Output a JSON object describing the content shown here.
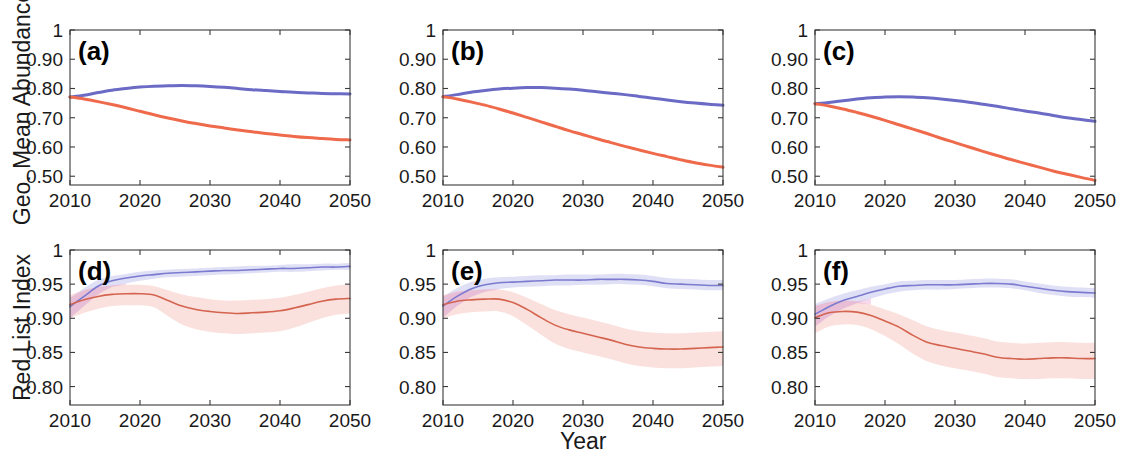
{
  "figure": {
    "width": 1126,
    "height": 458,
    "background": "#ffffff",
    "axis_labels": {
      "y_top": "Geo. Mean Abundance",
      "y_bottom": "Red List Index",
      "x": "Year"
    },
    "colors": {
      "blue_line": "#6b6bc6",
      "red_line": "#ee6a4b",
      "blue_line_thin": "#7b7bd0",
      "red_line_thin": "#d4644f",
      "blue_band": "#b9b9e8",
      "red_band": "#f3bdb4",
      "magenta_band": "#e8a6d8",
      "axis": "#3a3a3a",
      "text": "#1a1a1a"
    }
  },
  "chart_data": [
    {
      "type": "line",
      "panel": "a",
      "panel_label": "(a)",
      "title": "",
      "xlabel": "",
      "ylabel": "Geo. Mean Abundance",
      "xlim": [
        2010,
        2050
      ],
      "ylim": [
        0.47,
        1.0
      ],
      "xticks": [
        2010,
        2020,
        2030,
        2040,
        2050
      ],
      "xticklabels": [
        "2010",
        "2020",
        "2030",
        "2040",
        "2050"
      ],
      "yticks": [
        0.5,
        0.6,
        0.7,
        0.8,
        0.9,
        1.0
      ],
      "yticklabels": [
        "0.50",
        "0.60",
        "0.70",
        "0.80",
        "0.90",
        "1"
      ],
      "grid": false,
      "legend": "none",
      "x": [
        2010,
        2012,
        2014,
        2016,
        2018,
        2020,
        2022,
        2024,
        2026,
        2028,
        2030,
        2032,
        2034,
        2036,
        2038,
        2040,
        2042,
        2044,
        2046,
        2048,
        2050
      ],
      "series": [
        {
          "name": "blue",
          "color": "#6b6bc6",
          "values": [
            0.771,
            0.777,
            0.786,
            0.794,
            0.8,
            0.805,
            0.808,
            0.809,
            0.81,
            0.809,
            0.807,
            0.804,
            0.8,
            0.796,
            0.793,
            0.79,
            0.787,
            0.785,
            0.783,
            0.782,
            0.781
          ]
        },
        {
          "name": "red",
          "color": "#ee6a4b",
          "values": [
            0.771,
            0.764,
            0.755,
            0.745,
            0.734,
            0.722,
            0.71,
            0.699,
            0.689,
            0.68,
            0.672,
            0.665,
            0.658,
            0.652,
            0.646,
            0.641,
            0.636,
            0.632,
            0.629,
            0.626,
            0.624
          ]
        }
      ]
    },
    {
      "type": "line",
      "panel": "b",
      "panel_label": "(b)",
      "title": "",
      "xlabel": "",
      "ylabel": "Geo. Mean Abundance",
      "xlim": [
        2010,
        2050
      ],
      "ylim": [
        0.47,
        1.0
      ],
      "xticks": [
        2010,
        2020,
        2030,
        2040,
        2050
      ],
      "xticklabels": [
        "2010",
        "2020",
        "2030",
        "2040",
        "2050"
      ],
      "yticks": [
        0.5,
        0.6,
        0.7,
        0.8,
        0.9,
        1.0
      ],
      "yticklabels": [
        "0.50",
        "0.60",
        "0.70",
        "0.80",
        "0.90",
        "1"
      ],
      "grid": false,
      "legend": "none",
      "x": [
        2010,
        2012,
        2014,
        2016,
        2018,
        2020,
        2022,
        2024,
        2026,
        2028,
        2030,
        2032,
        2034,
        2036,
        2038,
        2040,
        2042,
        2044,
        2046,
        2048,
        2050
      ],
      "series": [
        {
          "name": "blue",
          "color": "#6b6bc6",
          "values": [
            0.772,
            0.779,
            0.787,
            0.793,
            0.798,
            0.801,
            0.803,
            0.803,
            0.801,
            0.798,
            0.794,
            0.789,
            0.784,
            0.779,
            0.773,
            0.767,
            0.761,
            0.755,
            0.75,
            0.746,
            0.743
          ]
        },
        {
          "name": "red",
          "color": "#ee6a4b",
          "values": [
            0.772,
            0.764,
            0.754,
            0.743,
            0.73,
            0.716,
            0.701,
            0.686,
            0.671,
            0.656,
            0.642,
            0.628,
            0.615,
            0.602,
            0.59,
            0.578,
            0.567,
            0.556,
            0.546,
            0.538,
            0.531
          ]
        }
      ]
    },
    {
      "type": "line",
      "panel": "c",
      "panel_label": "(c)",
      "title": "",
      "xlabel": "",
      "ylabel": "Geo. Mean Abundance",
      "xlim": [
        2010,
        2050
      ],
      "ylim": [
        0.47,
        1.0
      ],
      "xticks": [
        2010,
        2020,
        2030,
        2040,
        2050
      ],
      "xticklabels": [
        "2010",
        "2020",
        "2030",
        "2040",
        "2050"
      ],
      "yticks": [
        0.5,
        0.6,
        0.7,
        0.8,
        0.9,
        1.0
      ],
      "yticklabels": [
        "0.50",
        "0.60",
        "0.70",
        "0.80",
        "0.90",
        "1"
      ],
      "grid": false,
      "legend": "none",
      "x": [
        2010,
        2012,
        2014,
        2016,
        2018,
        2020,
        2022,
        2024,
        2026,
        2028,
        2030,
        2032,
        2034,
        2036,
        2038,
        2040,
        2042,
        2044,
        2046,
        2048,
        2050
      ],
      "series": [
        {
          "name": "blue",
          "color": "#6b6bc6",
          "values": [
            0.748,
            0.752,
            0.758,
            0.764,
            0.768,
            0.771,
            0.772,
            0.771,
            0.768,
            0.764,
            0.759,
            0.753,
            0.746,
            0.739,
            0.731,
            0.723,
            0.716,
            0.708,
            0.7,
            0.694,
            0.688
          ]
        },
        {
          "name": "red",
          "color": "#ee6a4b",
          "values": [
            0.748,
            0.74,
            0.73,
            0.718,
            0.705,
            0.691,
            0.676,
            0.661,
            0.646,
            0.63,
            0.615,
            0.6,
            0.585,
            0.571,
            0.557,
            0.544,
            0.531,
            0.518,
            0.507,
            0.496,
            0.486
          ]
        }
      ]
    },
    {
      "type": "line",
      "panel": "d",
      "panel_label": "(d)",
      "title": "",
      "xlabel": "Year",
      "ylabel": "Red List Index",
      "xlim": [
        2010,
        2050
      ],
      "ylim": [
        0.773,
        1.0
      ],
      "xticks": [
        2010,
        2020,
        2030,
        2040,
        2050
      ],
      "xticklabels": [
        "2010",
        "2020",
        "2030",
        "2040",
        "2050"
      ],
      "yticks": [
        0.8,
        0.85,
        0.9,
        0.95,
        1.0
      ],
      "yticklabels": [
        "0.80",
        "0.85",
        "0.90",
        "0.95",
        "1"
      ],
      "grid": false,
      "legend": "none",
      "x": [
        2010,
        2012,
        2014,
        2016,
        2018,
        2020,
        2022,
        2024,
        2026,
        2028,
        2030,
        2032,
        2034,
        2036,
        2038,
        2040,
        2042,
        2044,
        2046,
        2048,
        2050
      ],
      "series": [
        {
          "name": "blue",
          "color": "#7b7bd0",
          "values": [
            0.917,
            0.932,
            0.947,
            0.955,
            0.959,
            0.962,
            0.964,
            0.966,
            0.967,
            0.968,
            0.969,
            0.97,
            0.97,
            0.971,
            0.972,
            0.973,
            0.973,
            0.974,
            0.975,
            0.975,
            0.976
          ],
          "band_low": [
            0.9,
            0.918,
            0.935,
            0.946,
            0.951,
            0.955,
            0.958,
            0.96,
            0.961,
            0.962,
            0.963,
            0.964,
            0.965,
            0.966,
            0.967,
            0.968,
            0.968,
            0.969,
            0.97,
            0.971,
            0.971
          ],
          "band_high": [
            0.93,
            0.944,
            0.956,
            0.962,
            0.965,
            0.968,
            0.97,
            0.971,
            0.972,
            0.973,
            0.974,
            0.975,
            0.976,
            0.977,
            0.977,
            0.978,
            0.979,
            0.979,
            0.98,
            0.98,
            0.981
          ]
        },
        {
          "name": "red",
          "color": "#d4644f",
          "values": [
            0.92,
            0.927,
            0.932,
            0.935,
            0.936,
            0.936,
            0.934,
            0.926,
            0.918,
            0.913,
            0.91,
            0.908,
            0.907,
            0.908,
            0.909,
            0.911,
            0.915,
            0.92,
            0.925,
            0.928,
            0.929
          ],
          "band_low": [
            0.9,
            0.908,
            0.914,
            0.918,
            0.919,
            0.919,
            0.916,
            0.903,
            0.891,
            0.884,
            0.88,
            0.878,
            0.877,
            0.878,
            0.879,
            0.881,
            0.886,
            0.893,
            0.9,
            0.905,
            0.907
          ],
          "band_high": [
            0.934,
            0.941,
            0.946,
            0.948,
            0.949,
            0.949,
            0.947,
            0.941,
            0.935,
            0.931,
            0.928,
            0.926,
            0.926,
            0.927,
            0.928,
            0.93,
            0.934,
            0.939,
            0.944,
            0.948,
            0.95
          ]
        }
      ]
    },
    {
      "type": "line",
      "panel": "e",
      "panel_label": "(e)",
      "title": "",
      "xlabel": "Year",
      "ylabel": "Red List Index",
      "xlim": [
        2010,
        2050
      ],
      "ylim": [
        0.773,
        1.0
      ],
      "xticks": [
        2010,
        2020,
        2030,
        2040,
        2050
      ],
      "xticklabels": [
        "2010",
        "2020",
        "2030",
        "2040",
        "2050"
      ],
      "yticks": [
        0.8,
        0.85,
        0.9,
        0.95,
        1.0
      ],
      "yticklabels": [
        "0.80",
        "0.85",
        "0.90",
        "0.95",
        "1"
      ],
      "grid": false,
      "legend": "none",
      "x": [
        2010,
        2012,
        2014,
        2016,
        2018,
        2020,
        2022,
        2024,
        2026,
        2028,
        2030,
        2032,
        2034,
        2036,
        2038,
        2040,
        2042,
        2044,
        2046,
        2048,
        2050
      ],
      "series": [
        {
          "name": "blue",
          "color": "#7b7bd0",
          "values": [
            0.918,
            0.932,
            0.943,
            0.949,
            0.952,
            0.953,
            0.954,
            0.955,
            0.956,
            0.956,
            0.956,
            0.957,
            0.957,
            0.957,
            0.956,
            0.954,
            0.951,
            0.95,
            0.949,
            0.948,
            0.948
          ],
          "band_low": [
            0.901,
            0.918,
            0.931,
            0.939,
            0.943,
            0.945,
            0.946,
            0.947,
            0.948,
            0.948,
            0.949,
            0.949,
            0.95,
            0.95,
            0.949,
            0.947,
            0.944,
            0.943,
            0.942,
            0.941,
            0.941
          ],
          "band_high": [
            0.932,
            0.944,
            0.953,
            0.958,
            0.96,
            0.961,
            0.962,
            0.963,
            0.963,
            0.964,
            0.964,
            0.964,
            0.965,
            0.965,
            0.964,
            0.962,
            0.959,
            0.958,
            0.957,
            0.956,
            0.956
          ]
        },
        {
          "name": "red",
          "color": "#d4644f",
          "values": [
            0.92,
            0.925,
            0.927,
            0.928,
            0.928,
            0.923,
            0.913,
            0.901,
            0.89,
            0.883,
            0.878,
            0.873,
            0.868,
            0.862,
            0.858,
            0.856,
            0.855,
            0.855,
            0.856,
            0.857,
            0.858
          ],
          "band_low": [
            0.9,
            0.906,
            0.909,
            0.91,
            0.91,
            0.903,
            0.89,
            0.876,
            0.863,
            0.855,
            0.85,
            0.845,
            0.84,
            0.834,
            0.83,
            0.828,
            0.827,
            0.827,
            0.828,
            0.829,
            0.83
          ],
          "band_high": [
            0.934,
            0.939,
            0.941,
            0.942,
            0.942,
            0.938,
            0.93,
            0.921,
            0.912,
            0.906,
            0.901,
            0.896,
            0.891,
            0.885,
            0.881,
            0.879,
            0.878,
            0.878,
            0.879,
            0.88,
            0.881
          ]
        }
      ]
    },
    {
      "type": "line",
      "panel": "f",
      "panel_label": "(f)",
      "title": "",
      "xlabel": "Year",
      "ylabel": "Red List Index",
      "xlim": [
        2010,
        2050
      ],
      "ylim": [
        0.773,
        1.0
      ],
      "xticks": [
        2010,
        2020,
        2030,
        2040,
        2050
      ],
      "xticklabels": [
        "2010",
        "2020",
        "2030",
        "2040",
        "2050"
      ],
      "yticks": [
        0.8,
        0.85,
        0.9,
        0.95,
        1.0
      ],
      "yticklabels": [
        "0.80",
        "0.85",
        "0.90",
        "0.95",
        "1"
      ],
      "grid": false,
      "legend": "none",
      "x": [
        2010,
        2012,
        2014,
        2016,
        2018,
        2020,
        2022,
        2024,
        2026,
        2028,
        2030,
        2032,
        2034,
        2036,
        2038,
        2040,
        2042,
        2044,
        2046,
        2048,
        2050
      ],
      "series": [
        {
          "name": "blue",
          "color": "#7b7bd0",
          "values": [
            0.906,
            0.917,
            0.926,
            0.932,
            0.938,
            0.943,
            0.947,
            0.948,
            0.949,
            0.949,
            0.949,
            0.95,
            0.951,
            0.951,
            0.95,
            0.947,
            0.944,
            0.941,
            0.939,
            0.938,
            0.937
          ],
          "band_low": [
            0.888,
            0.903,
            0.914,
            0.922,
            0.929,
            0.935,
            0.939,
            0.941,
            0.942,
            0.942,
            0.943,
            0.944,
            0.945,
            0.945,
            0.944,
            0.941,
            0.937,
            0.934,
            0.932,
            0.931,
            0.93
          ],
          "band_high": [
            0.921,
            0.929,
            0.936,
            0.941,
            0.946,
            0.95,
            0.954,
            0.955,
            0.956,
            0.956,
            0.956,
            0.957,
            0.958,
            0.958,
            0.957,
            0.954,
            0.951,
            0.948,
            0.946,
            0.945,
            0.944
          ]
        },
        {
          "name": "red",
          "color": "#d4644f",
          "values": [
            0.901,
            0.908,
            0.91,
            0.909,
            0.904,
            0.896,
            0.887,
            0.875,
            0.865,
            0.86,
            0.856,
            0.852,
            0.848,
            0.843,
            0.841,
            0.84,
            0.841,
            0.842,
            0.842,
            0.841,
            0.841
          ],
          "band_low": [
            0.878,
            0.888,
            0.891,
            0.89,
            0.884,
            0.874,
            0.862,
            0.848,
            0.837,
            0.831,
            0.827,
            0.823,
            0.819,
            0.814,
            0.812,
            0.811,
            0.811,
            0.812,
            0.812,
            0.811,
            0.811
          ],
          "band_high": [
            0.918,
            0.924,
            0.926,
            0.925,
            0.92,
            0.913,
            0.906,
            0.897,
            0.888,
            0.883,
            0.879,
            0.875,
            0.871,
            0.866,
            0.864,
            0.863,
            0.864,
            0.865,
            0.865,
            0.864,
            0.864
          ]
        }
      ]
    }
  ]
}
